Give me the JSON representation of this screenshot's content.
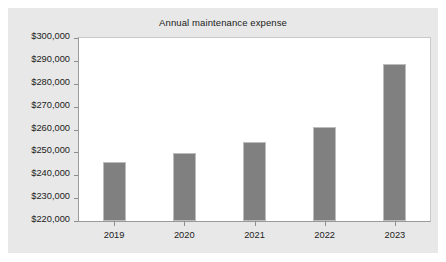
{
  "chart_data": {
    "type": "bar",
    "title": "Annual maintenance expense",
    "xlabel": "",
    "ylabel": "",
    "categories": [
      "2019",
      "2020",
      "2021",
      "2022",
      "2023"
    ],
    "values": [
      245700,
      249700,
      254500,
      261000,
      288600
    ],
    "ylim": [
      220000,
      300000
    ],
    "ytick_step": 10000,
    "ytick_labels": [
      "$300,000",
      "$290,000",
      "$280,000",
      "$270,000",
      "$260,000",
      "$250,000",
      "$240,000",
      "$230,000",
      "$220,000"
    ],
    "ytick_values": [
      300000,
      290000,
      280000,
      270000,
      260000,
      250000,
      240000,
      230000,
      220000
    ],
    "grid": false,
    "legend": null,
    "bar_color": "#808080",
    "bar_border_color": "#bdbdbd",
    "plot_background": "#ffffff",
    "figure_background": "#e8e8e8",
    "axis_color": "#8e8e8e"
  }
}
